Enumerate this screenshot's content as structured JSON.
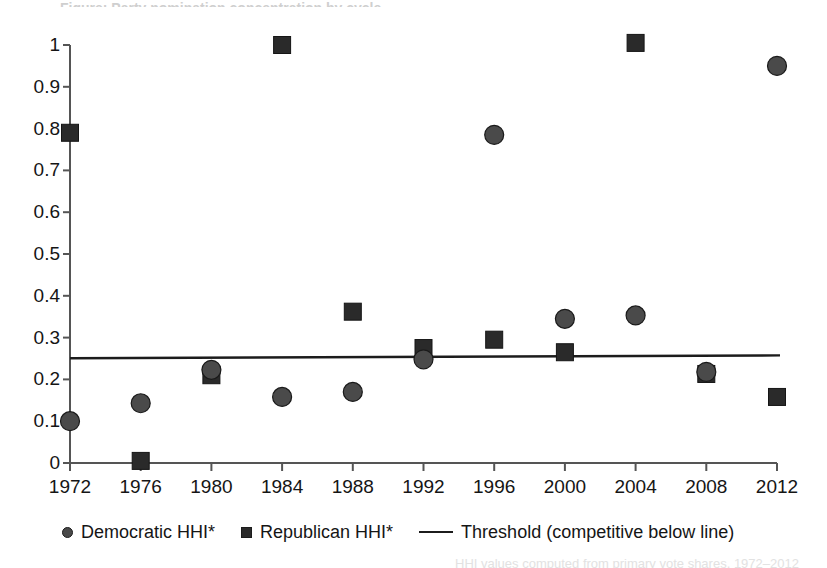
{
  "chart_data": {
    "type": "scatter",
    "title": "",
    "xlabel": "",
    "ylabel": "",
    "categories": [
      1972,
      1976,
      1980,
      1984,
      1988,
      1992,
      1996,
      2000,
      2004,
      2008,
      2012
    ],
    "xtick_labels": [
      "1972",
      "1976",
      "1980",
      "1984",
      "1988",
      "1992",
      "1996",
      "2000",
      "2004",
      "2008",
      "2012"
    ],
    "ytick_labels": [
      "1",
      "0.9",
      "0.8",
      "0.7",
      "0.6",
      "0.5",
      "0.4",
      "0.3",
      "0.2",
      "0.1",
      "0"
    ],
    "ylim": [
      0,
      1
    ],
    "xlim": [
      1972,
      2012
    ],
    "grid": false,
    "legend_position": "bottom-left",
    "series": [
      {
        "name": "Democratic HHI*",
        "marker": "circle",
        "color": "#4a4a4a",
        "values": [
          0.1,
          0.143,
          0.223,
          0.158,
          0.17,
          0.248,
          0.785,
          0.345,
          0.353,
          0.218,
          0.95
        ]
      },
      {
        "name": "Republican HHI*",
        "marker": "square",
        "color": "#2a2a2a",
        "values": [
          0.79,
          0.005,
          0.21,
          1.0,
          0.362,
          0.275,
          0.295,
          0.265,
          1.005,
          0.213,
          0.158
        ]
      }
    ],
    "threshold": {
      "name": "Threshold (competitive below line)",
      "marker": "line",
      "color": "#1c1c1c",
      "y_start": 0.2505,
      "y_end": 0.2575
    }
  },
  "legend": {
    "items": [
      {
        "label": "Democratic HHI*",
        "marker": "circle"
      },
      {
        "label": "Republican HHI*",
        "marker": "square"
      },
      {
        "label": "Threshold (competitive below line)",
        "marker": "line"
      }
    ]
  },
  "title_sliver": "Figure: Party nomination concentration by cycle",
  "footnote_sliver": "HHI values computed from primary vote shares, 1972–2012"
}
